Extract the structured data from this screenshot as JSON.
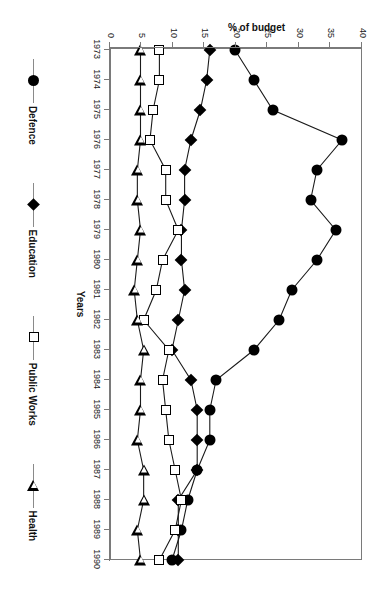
{
  "chart_data": {
    "type": "line",
    "title": "",
    "xlabel": "Years",
    "ylabel": "% of budget",
    "ylim": [
      0,
      40
    ],
    "ytick_step": 5,
    "grid": false,
    "legend_position": "bottom",
    "categories": [
      "1973",
      "1974",
      "1975",
      "1976",
      "1977",
      "1978",
      "1979",
      "1980",
      "1981",
      "1982",
      "1983",
      "1984",
      "1985",
      "1986",
      "1987",
      "1988",
      "1989",
      "1990"
    ],
    "x": [
      1973,
      1974,
      1975,
      1976,
      1977,
      1978,
      1979,
      1980,
      1981,
      1982,
      1983,
      1984,
      1985,
      1986,
      1987,
      1988,
      1989,
      1990
    ],
    "yticks": [
      0,
      5,
      10,
      15,
      20,
      25,
      30,
      35,
      40
    ],
    "series": [
      {
        "name": "Defence",
        "marker": "filled-circle",
        "color": "#000000",
        "values": [
          20,
          23,
          26,
          37,
          33,
          32,
          36,
          33,
          29,
          27,
          23,
          17,
          16,
          16,
          14,
          12.5,
          11.5,
          10
        ]
      },
      {
        "name": "Education",
        "marker": "filled-diamond",
        "color": "#000000",
        "values": [
          16,
          15.5,
          14.5,
          13,
          12,
          12,
          11.5,
          11.5,
          12,
          11,
          10,
          13,
          14,
          14,
          14,
          11,
          11,
          11
        ]
      },
      {
        "name": "Public Works",
        "marker": "open-square",
        "color": "#000000",
        "values": [
          8,
          8,
          7,
          6.5,
          9,
          9,
          11,
          8.5,
          7.5,
          5.5,
          9.5,
          8.5,
          9,
          9.5,
          10.5,
          11.5,
          10.5,
          8
        ]
      },
      {
        "name": "Health",
        "marker": "open-triangle",
        "color": "#000000",
        "values": [
          5,
          5,
          5,
          5,
          4.5,
          4.5,
          5,
          4.5,
          4,
          4.5,
          5.5,
          5,
          5,
          4.5,
          5.5,
          5.5,
          4.5,
          5
        ]
      }
    ]
  },
  "legend": {
    "entries": [
      {
        "label": "Defence",
        "marker": "filled-circle"
      },
      {
        "label": "Education",
        "marker": "filled-diamond"
      },
      {
        "label": "Public Works",
        "marker": "open-square"
      },
      {
        "label": "Health",
        "marker": "open-triangle"
      }
    ]
  },
  "colors": {
    "axis": "#7a7a7a",
    "line": "#1a1a1a",
    "text": "#111111",
    "background": "#ffffff"
  }
}
